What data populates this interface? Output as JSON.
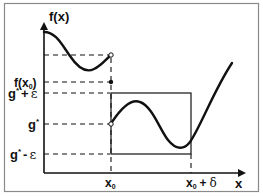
{
  "diagram": {
    "y_axis_label": "f(x)",
    "x_axis_label": "x",
    "y_labels": {
      "fx0": "f(x",
      "fx0_sub": "0",
      "fx0_close": ")",
      "g_plus_eps": "g",
      "g_plus_eps_sup": "*",
      "g_plus_eps_op": "+",
      "g_plus_eps_eps": "ε",
      "g_star": "g",
      "g_star_sup": "*",
      "g_minus_eps": "g",
      "g_minus_eps_sup": "*",
      "g_minus_eps_op": "-",
      "g_minus_eps_eps": "ε"
    },
    "x_labels": {
      "x0": "x",
      "x0_sub": "0",
      "x0_delta": "x",
      "x0_delta_sub": "0",
      "x0_delta_op": "+",
      "x0_delta_delta": "δ"
    },
    "points": {
      "open_top": "left limit at x0 (open circle)",
      "filled": "f(x0) (filled dot)",
      "open_gstar": "right limit g* at x0 (open circle)"
    },
    "colors": {
      "stroke": "#111111",
      "frame": "#8a8a8a",
      "background": "#ffffff"
    }
  }
}
